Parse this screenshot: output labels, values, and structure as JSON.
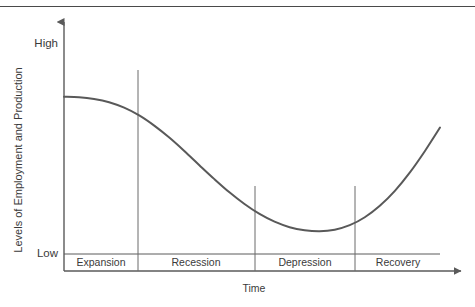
{
  "figure": {
    "name": "business-cycle-diagram",
    "top_rule": true
  },
  "chart_data": {
    "type": "line",
    "title": "",
    "xlabel": "Time",
    "ylabel": "Levels of Employment and Production",
    "ytick_labels": [
      "High",
      "Low"
    ],
    "xtick_labels": [],
    "grid": false,
    "legend": null,
    "axis_arrows": {
      "y": "up",
      "x": "right"
    },
    "xlim": [
      0,
      100
    ],
    "ylim": [
      0,
      100
    ],
    "annotations": [
      {
        "label": "Expansion",
        "x_start": 0,
        "x_end": 19.5
      },
      {
        "label": "Recession",
        "x_start": 19.5,
        "x_end": 48.0
      },
      {
        "label": "Depression",
        "x_start": 48.0,
        "x_end": 74.0
      },
      {
        "label": "Recovery",
        "x_start": 74.0,
        "x_end": 100
      }
    ],
    "dividers": [
      {
        "x": 19.5,
        "y_top": 79.5,
        "y_bottom": 0
      },
      {
        "x": 48.0,
        "y_top": 34.5,
        "y_bottom": 0
      },
      {
        "x": 74.0,
        "y_top": 34.5,
        "y_bottom": 0
      }
    ],
    "series": [
      {
        "name": "Business cycle",
        "x": [
          0,
          4,
          8,
          12,
          16,
          20,
          24,
          28,
          32,
          36,
          40,
          44,
          48,
          52,
          56,
          60,
          64,
          68,
          72,
          76,
          80,
          84,
          88,
          92,
          96,
          100
        ],
        "y": [
          70,
          69.8,
          69.1,
          67.8,
          65.6,
          62.5,
          58.4,
          53.6,
          48.2,
          42.5,
          36.9,
          31.6,
          26.9,
          22.9,
          19.8,
          17.6,
          16.4,
          16.0,
          16.6,
          18.4,
          21.6,
          26.2,
          32.2,
          39.6,
          48.2,
          57.6
        ]
      }
    ]
  }
}
